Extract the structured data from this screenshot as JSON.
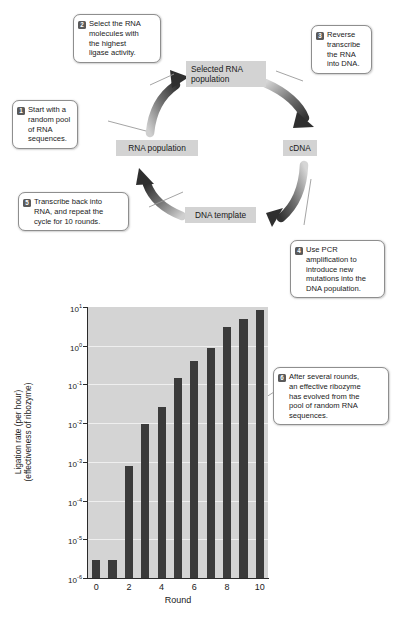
{
  "figure": {
    "cycle": {
      "nodes": [
        {
          "id": "selected-rna-population",
          "label": "Selected RNA\npopulation"
        },
        {
          "id": "cdna",
          "label": "cDNA"
        },
        {
          "id": "dna-template",
          "label": "DNA template"
        },
        {
          "id": "rna-population",
          "label": "RNA population"
        }
      ],
      "callouts": [
        {
          "num": "1",
          "text": "Start with a random pool of RNA sequences."
        },
        {
          "num": "2",
          "text": "Select the RNA molecules with the highest ligase activity."
        },
        {
          "num": "3",
          "text": "Reverse transcribe the RNA into DNA."
        },
        {
          "num": "4",
          "text": "Use PCR amplification to introduce new mutations into the DNA population."
        },
        {
          "num": "5",
          "text": "Transcribe back into RNA, and repeat the cycle for 10 rounds."
        },
        {
          "num": "6",
          "text": "After several rounds, an effective ribozyme has evolved from the pool of random RNA sequences."
        }
      ],
      "callout_lines": {
        "c1_l1": "Start with a",
        "c1_l2": "random pool",
        "c1_l3": "of RNA",
        "c1_l4": "sequences.",
        "c2_l1": "Select the RNA",
        "c2_l2": "molecules with",
        "c2_l3": "the highest",
        "c2_l4": "ligase activity.",
        "c3_l1": "Reverse",
        "c3_l2": "transcribe",
        "c3_l3": "the RNA",
        "c3_l4": "into DNA.",
        "c4_l1": "Use PCR",
        "c4_l2": "amplification to",
        "c4_l3": "introduce new",
        "c4_l4": "mutations into the",
        "c4_l5": "DNA population.",
        "c5_l1": "Transcribe back into",
        "c5_l2": "RNA, and repeat the",
        "c5_l3": "cycle for 10 rounds.",
        "c6_l1": "After several rounds,",
        "c6_l2": "an effective ribozyme",
        "c6_l3": "has evolved from the",
        "c6_l4": "pool of random RNA",
        "c6_l5": "sequences."
      }
    },
    "colors": {
      "node_fill": "#d3d3d3",
      "plot_bg": "#d4d4d4",
      "bar_fill": "#3b3b3b",
      "arrow_fill": "#3c3c3c",
      "callout_border": "#8e8e8e",
      "gridline": "#efefef"
    }
  },
  "chart_data": {
    "type": "bar",
    "title": "",
    "xlabel": "Round",
    "ylabel": "Ligation rate (per hour)\n(effectiveness of ribozyme)",
    "ylabel_line1": "Ligation rate (per hour)",
    "ylabel_line2": "(effectiveness of ribozyme)",
    "yscale": "log",
    "ylim": [
      1e-06,
      10
    ],
    "grid": true,
    "legend": "none",
    "categories": [
      0,
      1,
      2,
      3,
      4,
      5,
      6,
      7,
      8,
      9,
      10
    ],
    "values": [
      3e-06,
      3e-06,
      0.0008,
      0.0095,
      0.026,
      0.15,
      0.4,
      0.9,
      3.0,
      5.0,
      8.5
    ],
    "ytick_values": [
      10,
      1,
      0.1,
      0.01,
      0.001,
      0.0001,
      1e-05,
      1e-06
    ],
    "ytick_labels": [
      "10",
      "10",
      "10",
      "10",
      "10",
      "10",
      "10",
      "10"
    ],
    "ytick_exponents": [
      "1",
      "0",
      "-1",
      "-2",
      "-3",
      "-4",
      "-5",
      "-6"
    ],
    "xtick_labels": [
      "0",
      "2",
      "4",
      "6",
      "8",
      "10"
    ],
    "xtick_values": [
      0,
      2,
      4,
      6,
      8,
      10
    ]
  }
}
